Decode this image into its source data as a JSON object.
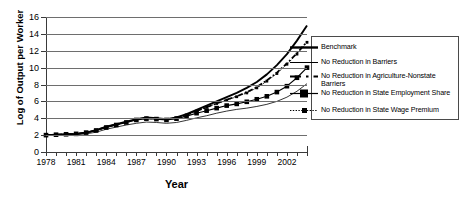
{
  "chart_data": {
    "type": "line",
    "title": "",
    "xlabel": "Year",
    "ylabel": "Log of Output per Worker",
    "xlim": [
      1978,
      2004
    ],
    "ylim": [
      0,
      16
    ],
    "yticks": [
      0,
      2,
      4,
      6,
      8,
      10,
      12,
      14,
      16
    ],
    "xticks": [
      1978,
      1979,
      1980,
      1981,
      1982,
      1983,
      1984,
      1985,
      1986,
      1987,
      1988,
      1989,
      1990,
      1991,
      1992,
      1993,
      1994,
      1995,
      1996,
      1997,
      1998,
      1999,
      2000,
      2001,
      2002,
      2003,
      2004
    ],
    "xtick_labels": [
      "1978",
      "",
      "",
      "1981",
      "",
      "",
      "1984",
      "",
      "",
      "1987",
      "",
      "",
      "1990",
      "",
      "",
      "1993",
      "",
      "",
      "1996",
      "",
      "",
      "1999",
      "",
      "",
      "2002",
      "",
      ""
    ],
    "grid": "horizontal",
    "legend_position": "right",
    "x": [
      1978,
      1979,
      1980,
      1981,
      1982,
      1983,
      1984,
      1985,
      1986,
      1987,
      1988,
      1989,
      1990,
      1991,
      1992,
      1993,
      1994,
      1995,
      1996,
      1997,
      1998,
      1999,
      2000,
      2001,
      2002,
      2003,
      2004
    ],
    "series": [
      {
        "name": "Benchmark",
        "style": "thick-solid",
        "marker": "none",
        "color": "#000000",
        "values": [
          2.0,
          2.05,
          2.1,
          2.15,
          2.3,
          2.6,
          3.0,
          3.3,
          3.6,
          3.9,
          4.1,
          4.0,
          3.9,
          4.1,
          4.5,
          5.0,
          5.5,
          6.0,
          6.5,
          7.0,
          7.6,
          8.3,
          9.2,
          10.3,
          11.6,
          13.2,
          15.0
        ]
      },
      {
        "name": "No Reduction in Barriers",
        "style": "thin-solid",
        "marker": "none",
        "color": "#000000",
        "values": [
          1.95,
          1.98,
          2.0,
          2.05,
          2.15,
          2.35,
          2.7,
          2.95,
          3.2,
          3.4,
          3.55,
          3.5,
          3.4,
          3.5,
          3.75,
          4.05,
          4.3,
          4.6,
          4.85,
          5.05,
          5.2,
          5.4,
          5.65,
          6.0,
          6.5,
          7.2,
          8.1
        ]
      },
      {
        "name": "No Reduction in Agriculture-Nonstate Barriers",
        "style": "dashed",
        "marker": "none",
        "color": "#000000",
        "values": [
          2.0,
          2.05,
          2.1,
          2.15,
          2.3,
          2.58,
          2.95,
          3.25,
          3.55,
          3.85,
          4.0,
          3.95,
          3.85,
          4.05,
          4.4,
          4.85,
          5.3,
          5.75,
          6.2,
          6.6,
          7.1,
          7.7,
          8.5,
          9.4,
          10.5,
          11.7,
          13.1
        ]
      },
      {
        "name": "No Reduction in State Employment Share",
        "style": "solid-marker",
        "marker": "square",
        "color": "#000000",
        "values": [
          2.0,
          2.05,
          2.1,
          2.15,
          2.3,
          2.55,
          2.9,
          3.2,
          3.5,
          3.8,
          3.95,
          3.9,
          3.8,
          3.95,
          4.25,
          4.6,
          4.9,
          5.2,
          5.5,
          5.7,
          5.95,
          6.25,
          6.6,
          7.1,
          7.8,
          8.8,
          10.0
        ]
      },
      {
        "name": "No Reduction in State Wage Premium",
        "style": "dotted-marker",
        "marker": "small-square",
        "color": "#000000",
        "values": [
          2.0,
          2.05,
          2.1,
          2.15,
          2.3,
          2.58,
          2.95,
          3.25,
          3.55,
          3.85,
          4.0,
          3.95,
          3.85,
          4.05,
          4.4,
          4.85,
          5.3,
          5.75,
          6.15,
          6.55,
          7.0,
          7.6,
          8.4,
          9.3,
          10.4,
          11.6,
          13.0
        ]
      }
    ]
  },
  "legend": {
    "items": [
      {
        "label": "Benchmark"
      },
      {
        "label": "No Reduction in Barriers"
      },
      {
        "label": "No Reduction in Agriculture-Nonstate Barriers"
      },
      {
        "label": "No Reduction in State Employment Share"
      },
      {
        "label": "No Reduction in State Wage Premium"
      }
    ]
  }
}
